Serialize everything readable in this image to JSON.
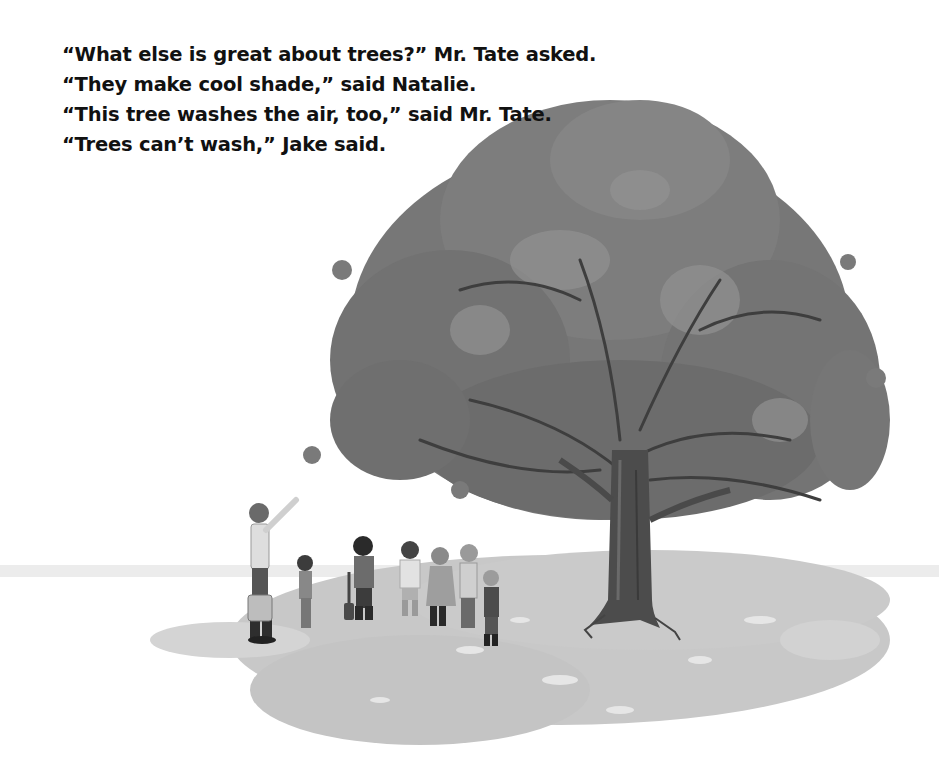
{
  "story": {
    "lines": [
      "“What else is great about trees?” Mr. Tate asked.",
      "“They make cool shade,” said Natalie.",
      "“This tree washes the air, too,” said Mr. Tate.",
      "“Trees can’t wash,” Jake said."
    ]
  },
  "illustration": {
    "subject": "large-oak-tree-with-teacher-and-children",
    "colors": {
      "foliage": "#6e6e6e",
      "foliage_light": "#8a8a8a",
      "trunk": "#4a4a4a",
      "shadow": "#c4c4c4",
      "ground_band": "#e4e4e4",
      "figure_dark": "#3a3a3a",
      "figure_light": "#d6d6d6"
    },
    "figures": [
      {
        "name": "mr-tate",
        "role": "teacher pointing up, holding bucket"
      },
      {
        "name": "child-1",
        "role": "girl with long hair"
      },
      {
        "name": "child-2",
        "role": "boy with shovel"
      },
      {
        "name": "child-3",
        "role": "child with spiky hair"
      },
      {
        "name": "child-4",
        "role": "girl with headband"
      },
      {
        "name": "child-5",
        "role": "boy in striped shirt"
      },
      {
        "name": "child-6",
        "role": "small boy with cap"
      }
    ]
  }
}
